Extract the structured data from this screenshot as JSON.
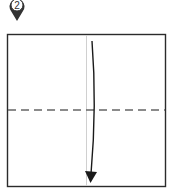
{
  "diagram": {
    "type": "origami-fold-step",
    "step_marker": {
      "label": "2",
      "color": "#333333"
    },
    "paper": {
      "fill": "#ffffff",
      "stroke": "#2b2b2b"
    },
    "center_crease": {
      "style": "thin-solid",
      "color": "#d0d0d0"
    },
    "fold_line": {
      "style": "valley-dashed",
      "color": "#666666"
    },
    "fold_arrow": {
      "direction": "down",
      "color": "#1a1a1a"
    }
  }
}
